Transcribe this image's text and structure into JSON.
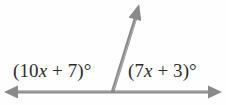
{
  "diagram": {
    "kind": "linear-pair-angle-diagram",
    "background_color": "#fefefe",
    "stroke_color": "#8a8a8a",
    "text_color": "#2b2b2b",
    "vertex": {
      "x": 112,
      "y": 92
    },
    "rays": [
      {
        "name": "ray-left",
        "from": {
          "x": 112,
          "y": 92
        },
        "to": {
          "x": 6,
          "y": 92
        },
        "arrowhead": true
      },
      {
        "name": "ray-right",
        "from": {
          "x": 112,
          "y": 92
        },
        "to": {
          "x": 220,
          "y": 92
        },
        "arrowhead": true
      },
      {
        "name": "ray-up",
        "from": {
          "x": 112,
          "y": 92
        },
        "to": {
          "x": 139,
          "y": 6
        },
        "arrowhead": true
      }
    ],
    "labels": {
      "left_angle": "(10x + 7)°",
      "right_angle": "(7x + 3)°"
    }
  }
}
